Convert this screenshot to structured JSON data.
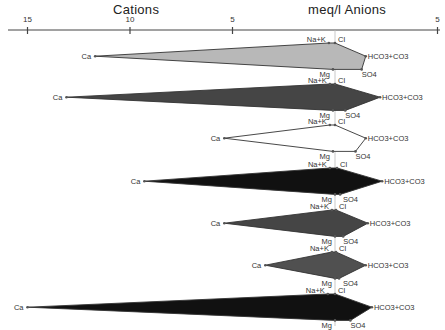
{
  "header": {
    "left_title": "Cations",
    "right_title": "meq/l  Anions"
  },
  "chart_data": {
    "type": "stiff",
    "title": "",
    "xlabel_left": "Cations",
    "xlabel_right": "Anions",
    "unit": "meq/l",
    "axis": {
      "ticks_left": [
        15,
        10,
        5
      ],
      "ticks_right": [
        5
      ],
      "tick_labels": [
        "15",
        "10",
        "5",
        "5"
      ],
      "range_left": [
        0,
        15
      ],
      "range_right": [
        0,
        5
      ]
    },
    "rows": [
      {
        "cation_labels": [
          "Na+K",
          "Ca",
          "Mg"
        ],
        "anion_labels": [
          "Cl",
          "HCO3+CO3",
          "SO4"
        ]
      }
    ],
    "series": [
      {
        "name": "Sample 1",
        "fill": "#b8b8b8",
        "Na+K": 0.3,
        "Ca": 11.7,
        "Mg": 0.1,
        "Cl": 0.0,
        "HCO3+CO3": 1.5,
        "SO4": 1.3
      },
      {
        "name": "Sample 2",
        "fill": "#454545",
        "Na+K": 0.25,
        "Ca": 13.1,
        "Mg": 0.1,
        "Cl": 0.0,
        "HCO3+CO3": 2.2,
        "SO4": 0.5
      },
      {
        "name": "Sample 3",
        "fill": "#ffffff",
        "Na+K": 0.25,
        "Ca": 5.4,
        "Mg": 0.1,
        "Cl": 0.0,
        "HCO3+CO3": 1.5,
        "SO4": 1.0
      },
      {
        "name": "Sample 4",
        "fill": "#111111",
        "Na+K": 0.25,
        "Ca": 9.3,
        "Mg": 0.0,
        "Cl": 0.1,
        "HCO3+CO3": 2.3,
        "SO4": 0.25
      },
      {
        "name": "Sample 5",
        "fill": "#454545",
        "Na+K": 0.15,
        "Ca": 5.4,
        "Mg": 0.0,
        "Cl": 0.05,
        "HCO3+CO3": 1.6,
        "SO4": 0.4
      },
      {
        "name": "Sample 6",
        "fill": "#505050",
        "Na+K": 0.15,
        "Ca": 3.4,
        "Mg": 0.0,
        "Cl": 0.05,
        "HCO3+CO3": 1.5,
        "SO4": 0.2
      },
      {
        "name": "Sample 7",
        "fill": "#111111",
        "Na+K": 0.35,
        "Ca": 15.0,
        "Mg": 0.0,
        "Cl": 0.0,
        "HCO3+CO3": 1.8,
        "SO4": 0.75
      }
    ]
  },
  "labels": {
    "na_k": "Na+K",
    "ca": "Ca",
    "mg": "Mg",
    "cl": "Cl",
    "hco3": "HCO3+CO3",
    "so4": "SO4"
  }
}
